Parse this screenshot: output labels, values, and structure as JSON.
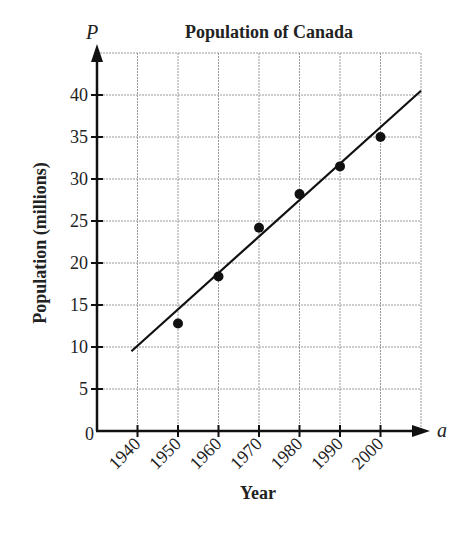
{
  "chart_data": {
    "type": "scatter",
    "title": "Population of Canada",
    "xlabel": "Year",
    "ylabel": "Population (millions)",
    "x_axis_variable": "a",
    "y_axis_variable": "P",
    "x_ticks": [
      "1940",
      "1950",
      "1960",
      "1970",
      "1980",
      "1990",
      "2000"
    ],
    "y_ticks": [
      "0",
      "5",
      "10",
      "15",
      "20",
      "25",
      "30",
      "35",
      "40"
    ],
    "xlim": [
      1930,
      2010
    ],
    "ylim": [
      0,
      45
    ],
    "grid": true,
    "legend": null,
    "series": [
      {
        "name": "Population data",
        "kind": "scatter",
        "x": [
          1950,
          1960,
          1970,
          1980,
          1990,
          2000
        ],
        "y": [
          12.8,
          18.4,
          24.2,
          28.2,
          31.5,
          35.0
        ]
      },
      {
        "name": "Line of best fit",
        "kind": "line",
        "x": [
          1938.5,
          2010
        ],
        "y": [
          9.5,
          40.5
        ]
      }
    ]
  },
  "colors": {
    "ink": "#111111",
    "grid": "#9a9a9a"
  }
}
